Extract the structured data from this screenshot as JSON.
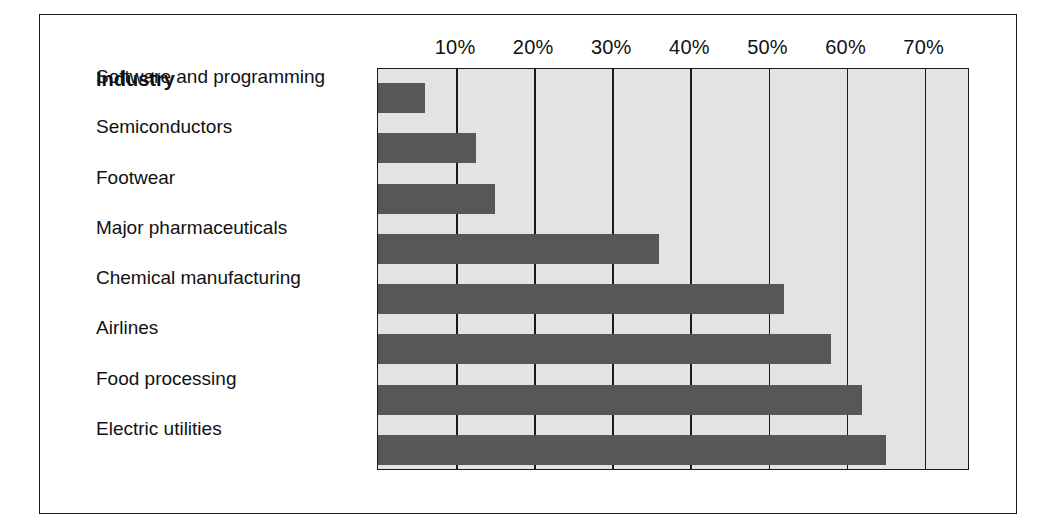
{
  "chart_data": {
    "type": "bar",
    "orientation": "horizontal",
    "title": "",
    "xlabel": "",
    "ylabel": "Industry",
    "categories": [
      "Software and programming",
      "Semiconductors",
      "Footwear",
      "Major pharmaceuticals",
      "Chemical manufacturing",
      "Airlines",
      "Food processing",
      "Electric utilities"
    ],
    "values": [
      6,
      12.5,
      15,
      36,
      52,
      58,
      62,
      65
    ],
    "value_unit": "%",
    "xlim": [
      0,
      75.8
    ],
    "xticks": [
      10,
      20,
      30,
      40,
      50,
      60,
      70
    ],
    "xtick_labels": [
      "10%",
      "20%",
      "30%",
      "40%",
      "50%",
      "60%",
      "70%"
    ],
    "grid": "vertical",
    "legend": "none",
    "bar_color": "#575757",
    "plot_background": "#e3e3e3",
    "axis_color": "#1a1a1a"
  },
  "labels": {
    "header": "Industry"
  }
}
